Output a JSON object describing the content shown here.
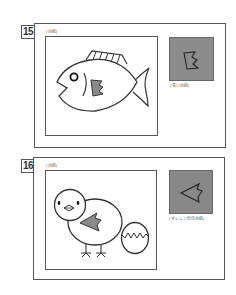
{
  "problems": [
    {
      "number": "15",
      "mount_label": "(台紙)",
      "swatch_label": "(青い台紙)",
      "swatch_color": "#8c8c8c",
      "picture": "fish",
      "cutout_shape": "zigzag-flag"
    },
    {
      "number": "16",
      "mount_label": "(台紙)",
      "swatch_label": "(オレンジ色の台紙)",
      "swatch_color": "#888888",
      "picture": "chick-and-egg",
      "cutout_shape": "arrowhead-left"
    }
  ],
  "colors": {
    "line": "#333333",
    "fill_gray": "#8a8a8a",
    "border": "#555555"
  }
}
